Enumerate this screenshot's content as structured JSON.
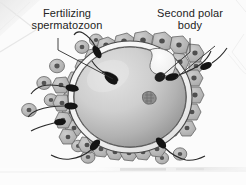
{
  "figure": {
    "type": "biological-illustration",
    "background_color": "#fbfbfb",
    "ink_color": "#232323",
    "labels": [
      {
        "id": "fertilizing-spermatozoon",
        "line1": "Fertilizing",
        "line2": "spermatozoon"
      },
      {
        "id": "second-polar-body",
        "line1": "Second polar",
        "line2": "body"
      }
    ],
    "structures": {
      "oocyte_label": "oocyte cytoplasm",
      "zona_pellucida_label": "zona pellucida",
      "corona_radiata_label": "corona radiata",
      "pronucleus_label": "pronucleus",
      "polar_body_label": "second polar body",
      "spermatozoa_label": "spermatozoa"
    },
    "colors": {
      "oocyte_fill_light": "#d8d8d8",
      "oocyte_fill_dark": "#9a9a9a",
      "zona_fill": "#f4f4f4",
      "corona_fill": "#bdbdbd",
      "corona_nucleus": "#5b5b5b",
      "sperm_head": "#1d1d1d",
      "outline": "#3a3a3a"
    },
    "counts": {
      "spermatozoa": 9,
      "corona_radiata_cells": 58
    }
  }
}
